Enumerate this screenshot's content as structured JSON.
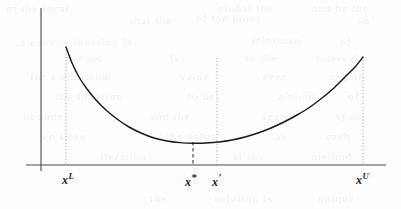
{
  "figure": {
    "background_color": "#fdfdfd",
    "curve_color": "#1a1a1a",
    "axis_color": "#4a4a4a",
    "dotted_guide_color": "#9a9a9a",
    "dashed_guide_color": "#6d6d6d"
  },
  "axes": {
    "y_axis": {
      "x": 41,
      "y_top": 8,
      "y_bottom": 171
    },
    "x_axis": {
      "y": 165,
      "x_left": 26,
      "x_right": 386
    }
  },
  "labels": [
    {
      "id": "lower-bound",
      "base": "x",
      "sup": "L",
      "sup_kind": "letter",
      "x": 62,
      "y": 171
    },
    {
      "id": "optimum",
      "base": "x",
      "sup": "*",
      "sup_kind": "star",
      "x": 185,
      "y": 171
    },
    {
      "id": "x-prime",
      "base": "x",
      "sup": "′",
      "sup_kind": "prime",
      "x": 212,
      "y": 171
    },
    {
      "id": "upper-bound",
      "base": "x",
      "sup": "U",
      "sup_kind": "letter",
      "x": 356,
      "y": 171
    }
  ],
  "guides": [
    {
      "id": "guide-lower-bound",
      "style": "dotted",
      "x": 66,
      "y_top": 47,
      "y_bottom": 165
    },
    {
      "id": "guide-optimum",
      "style": "dashed",
      "x": 193,
      "y_top": 142,
      "y_bottom": 165
    },
    {
      "id": "guide-x-prime",
      "style": "dotted",
      "x": 217,
      "y_top": 58,
      "y_bottom": 165
    },
    {
      "id": "guide-upper-bound",
      "style": "dotted",
      "x": 363,
      "y_top": 57,
      "y_bottom": 165
    }
  ],
  "chart_data": {
    "type": "line",
    "title": "",
    "xlabel": "",
    "ylabel": "",
    "grid": false,
    "legend": null,
    "series": [
      {
        "name": "f(x)",
        "description": "Convex U-shaped objective function, steeper on the left branch, with its unique minimum located at x*",
        "points_px": [
          [
            66,
            47
          ],
          [
            72,
            63
          ],
          [
            79,
            77
          ],
          [
            87,
            89
          ],
          [
            96,
            100
          ],
          [
            106,
            110
          ],
          [
            117,
            119
          ],
          [
            129,
            127
          ],
          [
            141,
            133
          ],
          [
            154,
            138
          ],
          [
            167,
            141
          ],
          [
            180,
            142.6
          ],
          [
            193,
            143.2
          ],
          [
            206,
            143
          ],
          [
            219,
            142
          ],
          [
            232,
            140
          ],
          [
            245,
            137
          ],
          [
            258,
            133
          ],
          [
            271,
            128
          ],
          [
            284,
            122
          ],
          [
            297,
            115
          ],
          [
            310,
            107
          ],
          [
            322,
            98
          ],
          [
            334,
            88
          ],
          [
            345,
            77
          ],
          [
            355,
            67
          ],
          [
            363,
            57
          ]
        ],
        "endpoints": {
          "left": "x^L",
          "right": "x^U"
        },
        "minimum": {
          "label": "x*",
          "x_px": 193,
          "y_px": 143.2
        }
      }
    ],
    "annotations": [
      {
        "text": "x^L",
        "kind": "x-tick",
        "note": "lower bound of the interval"
      },
      {
        "text": "x*",
        "kind": "x-tick",
        "note": "minimizer of the convex function"
      },
      {
        "text": "x'",
        "kind": "x-tick",
        "note": "reference point to the right of the minimizer"
      },
      {
        "text": "x^U",
        "kind": "x-tick",
        "note": "upper bound of the interval"
      }
    ]
  },
  "bleed_text": [
    {
      "text": "of the local",
      "x": 6,
      "y": 2
    },
    {
      "text": "global the",
      "x": 218,
      "y": 2
    },
    {
      "text": "and be the",
      "x": 312,
      "y": 2
    },
    {
      "text": "that the",
      "x": 130,
      "y": 14
    },
    {
      "text": "of the point",
      "x": 196,
      "y": 12
    },
    {
      "text": "so",
      "x": 358,
      "y": 14
    },
    {
      "text": "a convex function is",
      "x": 20,
      "y": 36
    },
    {
      "text": "minimum",
      "x": 252,
      "y": 34
    },
    {
      "text": "of",
      "x": 340,
      "y": 36
    },
    {
      "text": "the set",
      "x": 66,
      "y": 52
    },
    {
      "text": "is",
      "x": 170,
      "y": 52
    },
    {
      "text": "in the",
      "x": 246,
      "y": 52
    },
    {
      "text": "interval",
      "x": 316,
      "y": 52
    },
    {
      "text": "for a minimum",
      "x": 30,
      "y": 70
    },
    {
      "text": "value",
      "x": 180,
      "y": 70
    },
    {
      "text": "over",
      "x": 262,
      "y": 70
    },
    {
      "text": "region",
      "x": 330,
      "y": 70
    },
    {
      "text": "the function",
      "x": 56,
      "y": 90
    },
    {
      "text": "to be",
      "x": 188,
      "y": 90
    },
    {
      "text": "a point",
      "x": 278,
      "y": 90
    },
    {
      "text": "of",
      "x": 348,
      "y": 90
    },
    {
      "text": "bounds",
      "x": 24,
      "y": 110
    },
    {
      "text": "and the",
      "x": 150,
      "y": 110
    },
    {
      "text": "search",
      "x": 262,
      "y": 110
    },
    {
      "text": "space",
      "x": 336,
      "y": 110
    },
    {
      "text": "we know",
      "x": 40,
      "y": 130
    },
    {
      "text": "the value",
      "x": 166,
      "y": 130
    },
    {
      "text": "at",
      "x": 276,
      "y": 130
    },
    {
      "text": "each",
      "x": 326,
      "y": 130
    },
    {
      "text": "iteration",
      "x": 100,
      "y": 150
    },
    {
      "text": "of the",
      "x": 232,
      "y": 150
    },
    {
      "text": "method",
      "x": 312,
      "y": 150
    },
    {
      "text": "the",
      "x": 150,
      "y": 192
    },
    {
      "text": "solution is",
      "x": 214,
      "y": 192
    },
    {
      "text": "unique",
      "x": 318,
      "y": 192
    }
  ]
}
